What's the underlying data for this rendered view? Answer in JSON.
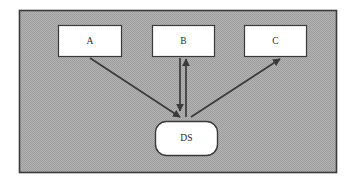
{
  "diagram": {
    "frame": {
      "name": "outer-frame",
      "fill_pattern": "dithered-gray",
      "fill_color": "#a9a9a9",
      "border_color": "#3a3a3a",
      "x": 19,
      "y": 10,
      "width": 318,
      "height": 163
    },
    "nodes": [
      {
        "id": "A",
        "label": "A",
        "shape": "rectangle",
        "x": 58,
        "y": 25,
        "width": 64,
        "height": 32,
        "fill": "#ffffff",
        "stroke": "#3a3a3a"
      },
      {
        "id": "B",
        "label": "B",
        "shape": "rectangle",
        "x": 152,
        "y": 25,
        "width": 63,
        "height": 32,
        "fill": "#ffffff",
        "stroke": "#3a3a3a"
      },
      {
        "id": "C",
        "label": "C",
        "shape": "rectangle",
        "x": 244,
        "y": 25,
        "width": 63,
        "height": 32,
        "fill": "#ffffff",
        "stroke": "#3a3a3a"
      },
      {
        "id": "DS",
        "label": "DS",
        "shape": "rounded-rectangle",
        "x": 155,
        "y": 121,
        "width": 63,
        "height": 35,
        "corner_radius": 11,
        "fill": "#ffffff",
        "stroke": "#3a3a3a"
      }
    ],
    "edges": [
      {
        "id": "a-to-ds",
        "from": "A",
        "to": "DS",
        "direction": "forward",
        "arrowhead_at": "DS",
        "x1": 90,
        "y1": 58,
        "x2": 180,
        "y2": 118,
        "color": "#3a3a3a"
      },
      {
        "id": "b-to-ds",
        "from": "B",
        "to": "DS",
        "direction": "forward",
        "arrowhead_at": "DS",
        "x1": 180,
        "y1": 58,
        "x2": 180,
        "y2": 112,
        "color": "#3a3a3a"
      },
      {
        "id": "ds-to-b",
        "from": "DS",
        "to": "B",
        "direction": "forward",
        "arrowhead_at": "B",
        "x1": 186,
        "y1": 118,
        "x2": 186,
        "y2": 58,
        "color": "#3a3a3a"
      },
      {
        "id": "ds-to-c",
        "from": "DS",
        "to": "C",
        "direction": "forward",
        "arrowhead_at": "C",
        "x1": 191,
        "y1": 118,
        "x2": 281,
        "y2": 58,
        "color": "#3a3a3a"
      }
    ]
  }
}
